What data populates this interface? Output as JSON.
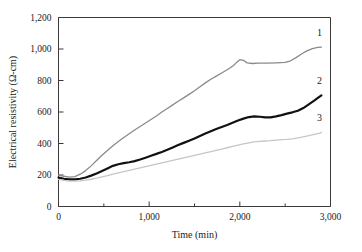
{
  "chart_data": {
    "type": "line",
    "title": "",
    "xlabel": "Time (min)",
    "ylabel": "Electrical resistivity (Ω-cm)",
    "xlim": [
      0,
      3000
    ],
    "ylim": [
      0,
      1200
    ],
    "grid": false,
    "legend_position": "curve-end-labels",
    "x_major_ticks": [
      0,
      1000,
      2000,
      3000
    ],
    "x_major_tick_labels": [
      "0",
      "1,000",
      "2,000",
      "3,000"
    ],
    "x_minor_ticks": [
      500,
      1500,
      2500
    ],
    "y_major_ticks": [
      0,
      200,
      400,
      600,
      800,
      1000,
      1200
    ],
    "y_major_tick_labels": [
      "0",
      "200",
      "400",
      "600",
      "800",
      "1,000",
      "1,200"
    ],
    "series": [
      {
        "name": "1",
        "label": "1",
        "color": "#8a8a8a",
        "width": 1.3,
        "x": [
          0,
          60,
          120,
          180,
          240,
          300,
          360,
          420,
          480,
          540,
          600,
          660,
          720,
          780,
          840,
          900,
          960,
          1020,
          1080,
          1140,
          1200,
          1260,
          1320,
          1380,
          1440,
          1500,
          1560,
          1620,
          1680,
          1740,
          1800,
          1860,
          1920,
          1960,
          2000,
          2040,
          2080,
          2140,
          2200,
          2300,
          2400,
          2500,
          2560,
          2620,
          2680,
          2740,
          2800,
          2860,
          2900
        ],
        "y": [
          200,
          192,
          187,
          190,
          205,
          228,
          258,
          292,
          325,
          356,
          385,
          412,
          438,
          462,
          486,
          508,
          530,
          552,
          575,
          600,
          622,
          645,
          668,
          690,
          712,
          735,
          760,
          785,
          808,
          828,
          848,
          868,
          890,
          912,
          932,
          928,
          912,
          908,
          910,
          910,
          912,
          915,
          925,
          945,
          968,
          988,
          1002,
          1010,
          1012
        ]
      },
      {
        "name": "2",
        "label": "2",
        "color": "#111111",
        "width": 2.2,
        "x": [
          0,
          60,
          120,
          180,
          240,
          300,
          360,
          420,
          480,
          540,
          600,
          660,
          720,
          780,
          840,
          900,
          960,
          1020,
          1080,
          1140,
          1200,
          1260,
          1320,
          1380,
          1440,
          1500,
          1560,
          1620,
          1680,
          1740,
          1800,
          1860,
          1920,
          1980,
          2040,
          2100,
          2160,
          2220,
          2280,
          2340,
          2400,
          2460,
          2520,
          2580,
          2640,
          2700,
          2760,
          2820,
          2880,
          2900
        ],
        "y": [
          183,
          176,
          172,
          172,
          176,
          184,
          196,
          210,
          226,
          242,
          258,
          268,
          275,
          281,
          288,
          298,
          310,
          322,
          334,
          346,
          360,
          375,
          390,
          404,
          418,
          432,
          448,
          464,
          478,
          492,
          505,
          518,
          532,
          546,
          558,
          568,
          572,
          570,
          566,
          566,
          572,
          580,
          590,
          598,
          608,
          625,
          648,
          672,
          698,
          706
        ]
      },
      {
        "name": "3",
        "label": "3",
        "color": "#c6c6c6",
        "width": 1.3,
        "x": [
          0,
          60,
          120,
          180,
          240,
          300,
          360,
          420,
          480,
          540,
          600,
          660,
          720,
          780,
          840,
          900,
          960,
          1020,
          1080,
          1140,
          1200,
          1260,
          1320,
          1380,
          1440,
          1500,
          1560,
          1620,
          1680,
          1740,
          1800,
          1860,
          1920,
          1980,
          2040,
          2100,
          2160,
          2220,
          2280,
          2340,
          2400,
          2460,
          2520,
          2580,
          2640,
          2700,
          2760,
          2820,
          2880,
          2900
        ],
        "y": [
          172,
          166,
          162,
          161,
          163,
          167,
          173,
          180,
          188,
          196,
          205,
          213,
          221,
          229,
          237,
          245,
          253,
          261,
          269,
          277,
          285,
          293,
          301,
          309,
          317,
          325,
          333,
          341,
          349,
          357,
          365,
          373,
          381,
          389,
          397,
          404,
          410,
          414,
          416,
          418,
          422,
          424,
          426,
          430,
          436,
          442,
          450,
          458,
          466,
          470
        ]
      }
    ]
  }
}
